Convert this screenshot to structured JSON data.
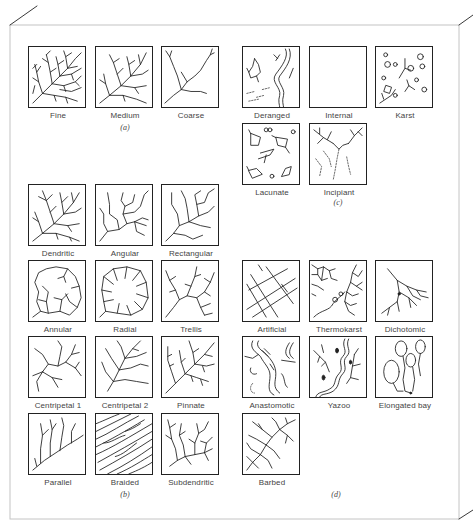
{
  "figure": {
    "groups": [
      {
        "id": "a",
        "label": "(a)",
        "items": [
          {
            "name": "Fine"
          },
          {
            "name": "Medium"
          },
          {
            "name": "Coarse"
          }
        ]
      },
      {
        "id": "b",
        "label": "(b)",
        "items": [
          {
            "name": "Dendritic"
          },
          {
            "name": "Angular"
          },
          {
            "name": "Rectangular"
          },
          {
            "name": "Annular"
          },
          {
            "name": "Radial"
          },
          {
            "name": "Trellis"
          },
          {
            "name": "Centripetal 1"
          },
          {
            "name": "Centripetal 2"
          },
          {
            "name": "Pinnate"
          },
          {
            "name": "Parallel"
          },
          {
            "name": "Braided"
          },
          {
            "name": "Subdendritic"
          }
        ]
      },
      {
        "id": "c",
        "label": "(c)",
        "items": [
          {
            "name": "Deranged"
          },
          {
            "name": "Internal"
          },
          {
            "name": "Karst"
          },
          {
            "name": "Lacunate"
          },
          {
            "name": "Incipiant"
          }
        ]
      },
      {
        "id": "d",
        "label": "(d)",
        "items": [
          {
            "name": "Artificial"
          },
          {
            "name": "Thermokarst"
          },
          {
            "name": "Dichotomic"
          },
          {
            "name": "Anastomotic"
          },
          {
            "name": "Yazoo"
          },
          {
            "name": "Elongated bay"
          },
          {
            "name": "Barbed"
          }
        ]
      }
    ]
  },
  "colors": {
    "stroke": "#222222",
    "frame": "#bbbbbb",
    "label_text": "#444444"
  }
}
